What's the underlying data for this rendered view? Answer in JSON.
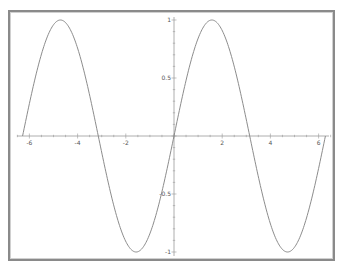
{
  "chart_data": {
    "type": "line",
    "title": "",
    "xlabel": "",
    "ylabel": "",
    "function": "sin(x)",
    "xlim": [
      -6.2832,
      6.2832
    ],
    "ylim": [
      -1,
      1
    ],
    "grid": false,
    "legend": null,
    "x_ticks": [
      -6,
      -4,
      -2,
      2,
      4,
      6
    ],
    "x_tick_labels": [
      "-6",
      "-4",
      "-2",
      "2",
      "4",
      "6"
    ],
    "y_ticks": [
      1,
      0.5,
      -0.5,
      -1
    ],
    "y_tick_labels": [
      "1",
      "0.5",
      "-0.5",
      "-1"
    ],
    "series": [
      {
        "name": "sin(x)",
        "color": "#8c8c8c",
        "x": [
          -6.2832,
          -5.4978,
          -4.7124,
          -3.927,
          -3.1416,
          -2.3562,
          -1.5708,
          -0.7854,
          0,
          0.7854,
          1.5708,
          2.3562,
          3.1416,
          3.927,
          4.7124,
          5.4978,
          6.2832
        ],
        "y": [
          0,
          0.7071,
          1,
          0.7071,
          0,
          -0.7071,
          -1,
          -0.7071,
          0,
          0.7071,
          1,
          0.7071,
          0,
          -0.7071,
          -1,
          -0.7071,
          0
        ]
      }
    ]
  },
  "style": {
    "frame_color": "#8a8a8a",
    "axis_color": "#999999",
    "curve_color": "#8c8c8c",
    "label_color": "#555555"
  }
}
